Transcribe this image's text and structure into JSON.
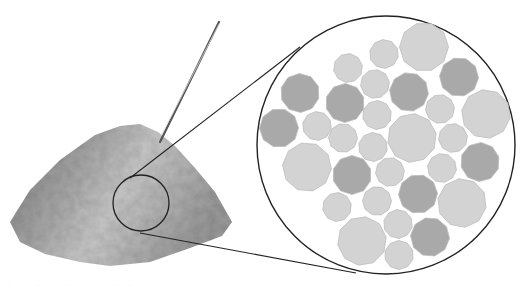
{
  "figure": {
    "colors": {
      "background": "#ffffff",
      "outline": "#222222",
      "grain_light": "#d3d3d3",
      "grain_dark": "#a9a9a9",
      "grain_border": "#bdbdbd",
      "pile_light": "#c8c8c8",
      "pile_dark": "#8a8a8a",
      "probe": "#555555"
    },
    "pile": {
      "outline_points": "10,222 30,190 60,160 95,135 120,126 140,124 158,132 175,146 195,168 215,192 232,222 222,236 190,248 150,262 110,266 80,262 45,254 20,242"
    },
    "probe": {
      "x1": 160,
      "y1": 142,
      "x2": 219,
      "y2": 22
    },
    "focus_circle": {
      "cx": 141,
      "cy": 203,
      "r": 28
    },
    "magnified_circle": {
      "cx": 386,
      "cy": 145,
      "r": 129
    },
    "connector_lines": [
      {
        "x1": 130,
        "y1": 178,
        "x2": 300,
        "y2": 47
      },
      {
        "x1": 140,
        "y1": 233,
        "x2": 356,
        "y2": 273
      }
    ],
    "grains": [
      {
        "cx": 424,
        "cy": 47,
        "d": 49,
        "shade": "light"
      },
      {
        "cx": 384,
        "cy": 54,
        "d": 29,
        "shade": "light"
      },
      {
        "cx": 348,
        "cy": 68,
        "d": 29,
        "shade": "light"
      },
      {
        "cx": 459,
        "cy": 77,
        "d": 39,
        "shade": "dark"
      },
      {
        "cx": 300,
        "cy": 93,
        "d": 39,
        "shade": "dark"
      },
      {
        "cx": 375,
        "cy": 84,
        "d": 29,
        "shade": "light"
      },
      {
        "cx": 409,
        "cy": 92,
        "d": 39,
        "shade": "dark"
      },
      {
        "cx": 345,
        "cy": 103,
        "d": 39,
        "shade": "dark"
      },
      {
        "cx": 440,
        "cy": 109,
        "d": 29,
        "shade": "light"
      },
      {
        "cx": 486,
        "cy": 114,
        "d": 49,
        "shade": "light"
      },
      {
        "cx": 377,
        "cy": 115,
        "d": 29,
        "shade": "light"
      },
      {
        "cx": 279,
        "cy": 128,
        "d": 39,
        "shade": "dark"
      },
      {
        "cx": 317,
        "cy": 126,
        "d": 29,
        "shade": "light"
      },
      {
        "cx": 412,
        "cy": 138,
        "d": 49,
        "shade": "light"
      },
      {
        "cx": 343,
        "cy": 138,
        "d": 29,
        "shade": "light"
      },
      {
        "cx": 373,
        "cy": 147,
        "d": 29,
        "shade": "light"
      },
      {
        "cx": 453,
        "cy": 138,
        "d": 29,
        "shade": "light"
      },
      {
        "cx": 307,
        "cy": 167,
        "d": 49,
        "shade": "light"
      },
      {
        "cx": 352,
        "cy": 175,
        "d": 39,
        "shade": "dark"
      },
      {
        "cx": 390,
        "cy": 172,
        "d": 29,
        "shade": "light"
      },
      {
        "cx": 442,
        "cy": 168,
        "d": 29,
        "shade": "light"
      },
      {
        "cx": 480,
        "cy": 162,
        "d": 39,
        "shade": "dark"
      },
      {
        "cx": 418,
        "cy": 194,
        "d": 39,
        "shade": "dark"
      },
      {
        "cx": 462,
        "cy": 203,
        "d": 49,
        "shade": "light"
      },
      {
        "cx": 337,
        "cy": 207,
        "d": 29,
        "shade": "light"
      },
      {
        "cx": 377,
        "cy": 201,
        "d": 29,
        "shade": "light"
      },
      {
        "cx": 398,
        "cy": 224,
        "d": 29,
        "shade": "light"
      },
      {
        "cx": 362,
        "cy": 241,
        "d": 49,
        "shade": "light"
      },
      {
        "cx": 430,
        "cy": 237,
        "d": 39,
        "shade": "dark"
      },
      {
        "cx": 399,
        "cy": 255,
        "d": 29,
        "shade": "light"
      }
    ],
    "caption_remnant": "· · ·  ·  ·  ·        ·         ·  ·"
  }
}
